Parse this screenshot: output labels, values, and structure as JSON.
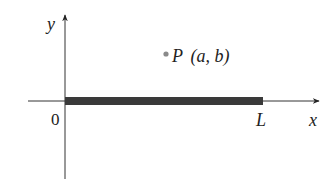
{
  "diagram": {
    "axes": {
      "x_label": "x",
      "y_label": "y",
      "origin_label": "0"
    },
    "rod": {
      "start_label": "0",
      "end_label": "L",
      "color": "#3a3a3a"
    },
    "point": {
      "name": "P",
      "coords": "(a, b)",
      "color": "#8a8a8a"
    },
    "colors": {
      "axis": "#333333",
      "text": "#222222"
    }
  }
}
